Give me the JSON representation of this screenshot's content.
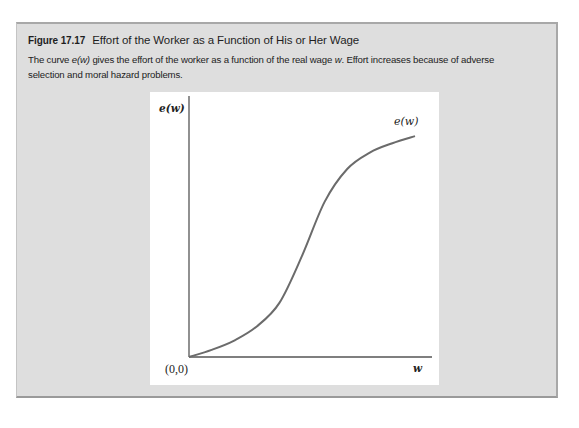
{
  "figure": {
    "number": "Figure 17.17",
    "title": "Effort of the Worker as a Function of His or Her Wage",
    "caption_parts": {
      "p1": "The curve ",
      "p2": "e(w)",
      "p3": " gives the effort of the worker as a function of the real wage ",
      "p4": "w",
      "p5": ". Effort increases because of adverse selection and moral hazard problems."
    }
  },
  "colors": {
    "panel_bg": "#dedede",
    "plot_bg": "#ffffff",
    "axis": "#555555",
    "curve": "#6b6b6b"
  },
  "chart_data": {
    "type": "line",
    "title": "Effort of the Worker as a Function of His or Her Wage",
    "xlabel": "w",
    "ylabel": "e(w)",
    "origin_label": "(0,0)",
    "grid": false,
    "legend": null,
    "annotations": [
      {
        "text": "e(w)",
        "position": "near upper-right end of curve"
      }
    ],
    "xlim": [
      0,
      1
    ],
    "ylim": [
      0,
      1
    ],
    "series": [
      {
        "name": "e(w)",
        "shape": "S-shaped (logistic): convex at low wages, inflection mid-range, concave and flattening at high wages",
        "x": [
          0.0,
          0.1,
          0.2,
          0.3,
          0.4,
          0.5,
          0.6,
          0.7,
          0.8,
          0.9,
          1.0
        ],
        "values": [
          0.0,
          0.03,
          0.07,
          0.13,
          0.23,
          0.43,
          0.66,
          0.8,
          0.87,
          0.91,
          0.94
        ]
      }
    ]
  }
}
